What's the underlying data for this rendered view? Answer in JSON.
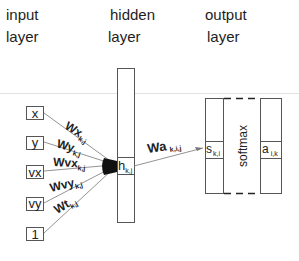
{
  "headers": {
    "input": [
      "input",
      "layer"
    ],
    "hidden": [
      "hidden",
      "layer"
    ],
    "output": [
      "output",
      "layer"
    ]
  },
  "inputs": [
    {
      "label": "x",
      "weight": "Wx",
      "sub": "k,j"
    },
    {
      "label": "y",
      "weight": "Wy",
      "sub": "k,j"
    },
    {
      "label": "vx",
      "weight": "Wvx",
      "sub": "k,j"
    },
    {
      "label": "vy",
      "weight": "Wvy",
      "sub": "k,j"
    },
    {
      "label": "1",
      "weight": "Wt",
      "sub": "k,j"
    }
  ],
  "hidden": {
    "node": "h",
    "sub": "k,j"
  },
  "connection": {
    "weight": "Wa",
    "sub": "k,i,j"
  },
  "output": {
    "score": "s",
    "score_sub": "k,i",
    "function": "softmax",
    "activation": "a",
    "activation_sub": "i,k"
  }
}
